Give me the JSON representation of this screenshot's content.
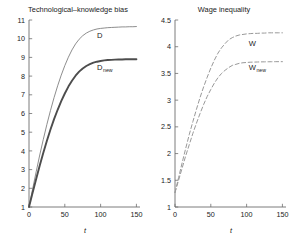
{
  "figure": {
    "background": "#ffffff",
    "panel_count": 2
  },
  "chart_data": [
    {
      "type": "line",
      "title": "Technological–knowledge bias",
      "xlabel": "t",
      "ylabel": "",
      "xlim": [
        0,
        155
      ],
      "ylim": [
        1,
        11
      ],
      "xticks": [
        0,
        50,
        100,
        150
      ],
      "xticklabels": [
        "0",
        "50",
        "100",
        "150"
      ],
      "yticks": [
        1,
        2,
        3,
        4,
        5,
        6,
        7,
        8,
        9,
        10,
        11
      ],
      "yticklabels": [
        "1",
        "2",
        "3",
        "4",
        "5",
        "6",
        "7",
        "8",
        "9",
        "10",
        "11"
      ],
      "grid": false,
      "legend": "inline-annotation",
      "x": [
        0,
        5,
        10,
        15,
        20,
        25,
        30,
        35,
        40,
        45,
        50,
        55,
        60,
        65,
        70,
        75,
        80,
        85,
        90,
        95,
        100,
        105,
        110,
        115,
        120,
        125,
        130,
        135,
        140,
        145,
        150
      ],
      "series": [
        {
          "name": "D",
          "label": "D",
          "color": "#808080",
          "linestyle": "solid",
          "linewidth": 0.9,
          "label_xy": [
            95,
            10.05
          ],
          "values": [
            1.0,
            1.95,
            2.88,
            3.78,
            4.62,
            5.42,
            6.16,
            6.85,
            7.48,
            8.05,
            8.56,
            9.01,
            9.4,
            9.72,
            9.97,
            10.16,
            10.3,
            10.4,
            10.47,
            10.52,
            10.55,
            10.57,
            10.59,
            10.6,
            10.61,
            10.62,
            10.63,
            10.63,
            10.64,
            10.64,
            10.65
          ]
        },
        {
          "name": "D_new",
          "label": "D",
          "label_sub": "new",
          "color": "#4d4d4d",
          "linestyle": "solid",
          "linewidth": 1.9,
          "label_xy": [
            95,
            8.35
          ],
          "values": [
            1.0,
            1.76,
            2.5,
            3.22,
            3.9,
            4.54,
            5.14,
            5.7,
            6.2,
            6.66,
            7.07,
            7.44,
            7.75,
            8.02,
            8.24,
            8.41,
            8.54,
            8.64,
            8.72,
            8.77,
            8.81,
            8.84,
            8.86,
            8.87,
            8.88,
            8.89,
            8.89,
            8.9,
            8.9,
            8.9,
            8.9
          ]
        }
      ]
    },
    {
      "type": "line",
      "title": "Wage inequality",
      "xlabel": "t",
      "ylabel": "",
      "xlim": [
        0,
        155
      ],
      "ylim": [
        1,
        4.5
      ],
      "xticks": [
        0,
        50,
        100,
        150
      ],
      "xticklabels": [
        "0",
        "50",
        "100",
        "150"
      ],
      "yticks": [
        1,
        1.5,
        2,
        2.5,
        3,
        3.5,
        4,
        4.5
      ],
      "yticklabels": [
        "1",
        "1.5",
        "2",
        "2.5",
        "3",
        "3.5",
        "4",
        "4.5"
      ],
      "grid": false,
      "legend": "inline-annotation",
      "x": [
        0,
        5,
        10,
        15,
        20,
        25,
        30,
        35,
        40,
        45,
        50,
        55,
        60,
        65,
        70,
        75,
        80,
        85,
        90,
        95,
        100,
        105,
        110,
        115,
        120,
        125,
        130,
        135,
        140,
        145,
        150
      ],
      "series": [
        {
          "name": "W",
          "label": "W",
          "color": "#999999",
          "linestyle": "dashed",
          "linewidth": 1.0,
          "label_xy": [
            103,
            4.02
          ],
          "values": [
            1.27,
            1.55,
            1.83,
            2.1,
            2.36,
            2.6,
            2.83,
            3.05,
            3.25,
            3.43,
            3.6,
            3.75,
            3.88,
            3.98,
            4.06,
            4.13,
            4.17,
            4.2,
            4.22,
            4.23,
            4.24,
            4.245,
            4.25,
            4.25,
            4.255,
            4.255,
            4.26,
            4.26,
            4.26,
            4.26,
            4.26
          ]
        },
        {
          "name": "W_new",
          "label": "W",
          "label_sub": "new",
          "color": "#999999",
          "linestyle": "dashed",
          "linewidth": 1.0,
          "label_xy": [
            103,
            3.56
          ],
          "values": [
            1.27,
            1.5,
            1.73,
            1.96,
            2.17,
            2.38,
            2.57,
            2.75,
            2.92,
            3.07,
            3.2,
            3.32,
            3.42,
            3.5,
            3.56,
            3.61,
            3.65,
            3.67,
            3.69,
            3.7,
            3.705,
            3.71,
            3.712,
            3.714,
            3.716,
            3.717,
            3.718,
            3.719,
            3.72,
            3.72,
            3.72
          ]
        }
      ]
    }
  ]
}
